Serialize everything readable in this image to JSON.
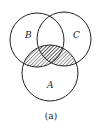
{
  "diagram": {
    "type": "venn",
    "sets": [
      {
        "label": "A",
        "cx": 50,
        "cy": 73,
        "r": 28
      },
      {
        "label": "B",
        "cx": 37,
        "cy": 40,
        "r": 27
      },
      {
        "label": "C",
        "cx": 64,
        "cy": 39,
        "r": 27
      }
    ],
    "shaded_region": "A ∩ (B ∪ C)",
    "caption": "(a)",
    "colors": {
      "stroke": "#222222",
      "hatch": "#333333",
      "background": "#ffffff"
    }
  }
}
